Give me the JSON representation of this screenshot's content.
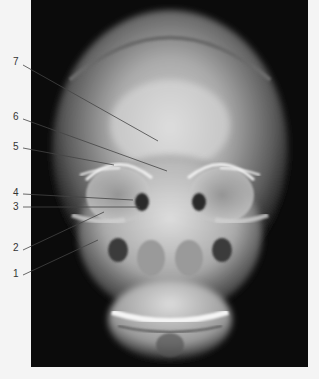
{
  "figure": {
    "type": "radiograph",
    "view": "frontal skull X-ray",
    "background_color": "#f4f4f4",
    "panel_color": "#0b0b0b",
    "line_color": "#444444"
  },
  "labels": [
    {
      "number": "7",
      "x": 13,
      "y": 57,
      "line": {
        "x1": 23,
        "y1": 65,
        "x2": 158,
        "y2": 141
      }
    },
    {
      "number": "6",
      "x": 13,
      "y": 112,
      "line": {
        "x1": 23,
        "y1": 119,
        "x2": 167,
        "y2": 171
      }
    },
    {
      "number": "5",
      "x": 13,
      "y": 142,
      "line": {
        "x1": 23,
        "y1": 148,
        "x2": 114,
        "y2": 165
      }
    },
    {
      "number": "4",
      "x": 13,
      "y": 188,
      "line": {
        "x1": 23,
        "y1": 194,
        "x2": 133,
        "y2": 200
      }
    },
    {
      "number": "3",
      "x": 13,
      "y": 202,
      "line": {
        "x1": 23,
        "y1": 207,
        "x2": 140,
        "y2": 207
      }
    },
    {
      "number": "2",
      "x": 13,
      "y": 243,
      "line": {
        "x1": 23,
        "y1": 250,
        "x2": 104,
        "y2": 212
      }
    },
    {
      "number": "1",
      "x": 13,
      "y": 269,
      "line": {
        "x1": 23,
        "y1": 275,
        "x2": 98,
        "y2": 240
      }
    }
  ]
}
